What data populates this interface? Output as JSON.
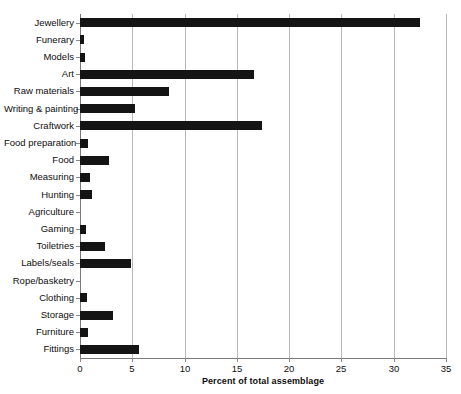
{
  "chart_data": {
    "type": "bar",
    "orientation": "horizontal",
    "title": "",
    "xlabel": "Percent of total assemblage",
    "ylabel": "",
    "xlim": [
      0,
      35
    ],
    "xticks": [
      0,
      5,
      10,
      15,
      20,
      25,
      30,
      35
    ],
    "xtick_labels": [
      "0",
      "5",
      "10",
      "15",
      "20",
      "25",
      "30",
      "35"
    ],
    "grid": true,
    "grid_axis": "x",
    "legend": false,
    "bar_color": "#141414",
    "categories": [
      "Jewellery",
      "Funerary",
      "Models",
      "Art",
      "Raw materials",
      "Writing & painting",
      "Craftwork",
      "Food preparation",
      "Food",
      "Measuring",
      "Hunting",
      "Agriculture",
      "Gaming",
      "Toiletries",
      "Labels/seals",
      "Rope/basketry",
      "Clothing",
      "Storage",
      "Furniture",
      "Fittings"
    ],
    "values": [
      32.5,
      0.4,
      0.5,
      16.6,
      8.5,
      5.3,
      17.4,
      0.8,
      2.8,
      1.0,
      1.1,
      0.0,
      0.6,
      2.4,
      4.9,
      0.0,
      0.7,
      3.2,
      0.8,
      5.6
    ]
  }
}
